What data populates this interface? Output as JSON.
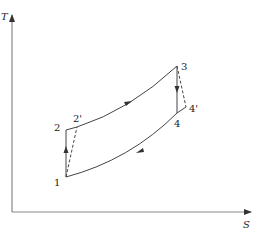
{
  "diagram": {
    "type": "T-S diagram (Brayton cycle with irreversible compression/expansion)",
    "axes": {
      "y_label": "T",
      "x_label": "S"
    },
    "points": [
      {
        "id": "1",
        "label": "1"
      },
      {
        "id": "2",
        "label": "2"
      },
      {
        "id": "2p",
        "label": "2'"
      },
      {
        "id": "3",
        "label": "3"
      },
      {
        "id": "4",
        "label": "4"
      },
      {
        "id": "4p",
        "label": "4'"
      }
    ],
    "processes": [
      {
        "from": "1",
        "to": "2",
        "style": "solid",
        "arrow": "up"
      },
      {
        "from": "1",
        "to": "2'",
        "style": "dashed"
      },
      {
        "from": "2",
        "to": "3",
        "style": "solid curve",
        "arrow": "forward"
      },
      {
        "from": "3",
        "to": "4",
        "style": "solid",
        "arrow": "down"
      },
      {
        "from": "3",
        "to": "4'",
        "style": "dashed"
      },
      {
        "from": "4",
        "to": "1",
        "style": "solid curve",
        "arrow": "backward"
      }
    ],
    "colors": {
      "line": "#444444",
      "axis": "#777777"
    }
  }
}
